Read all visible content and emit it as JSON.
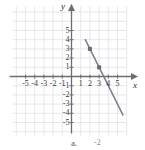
{
  "figure": {
    "width": 145,
    "height": 150,
    "background": "#ffffff",
    "axis_color": "#6d6d6d",
    "grid_color": "#e3e3ea",
    "line_color": "#7c7c86",
    "point_color": "#6a6a74",
    "label_color": "#3a3a3a"
  },
  "axes": {
    "x_name": "x",
    "y_name": "y",
    "x_ticks": [
      "-5",
      "-4",
      "-3",
      "-2",
      "-1",
      "1",
      "2",
      "3",
      "4",
      "5"
    ],
    "y_ticks": [
      "5",
      "4",
      "3",
      "2",
      "1",
      "-1",
      "-2",
      "-3",
      "-4",
      "-5"
    ],
    "x_tick_values": [
      -5,
      -4,
      -3,
      -2,
      -1,
      1,
      2,
      3,
      4,
      5
    ],
    "y_tick_values": [
      5,
      4,
      3,
      2,
      1,
      -1,
      -2,
      -3,
      -4,
      -5
    ]
  },
  "caption": {
    "letter": "a.",
    "value": "-2"
  },
  "chart_data": {
    "type": "line",
    "title": "",
    "xlabel": "x",
    "ylabel": "y",
    "xlim": [
      -6,
      6.2
    ],
    "ylim": [
      -6.2,
      7.2
    ],
    "grid": true,
    "legend": "none",
    "series": [
      {
        "name": "line",
        "slope": -2,
        "intercept": 7,
        "x": [
          1.5,
          5.6
        ],
        "y": [
          4.0,
          -4.2
        ]
      }
    ],
    "points": [
      {
        "x": 2,
        "y": 3,
        "marker": "square"
      },
      {
        "x": 3,
        "y": 1,
        "marker": "square"
      }
    ],
    "x_ticks": [
      -5,
      -4,
      -3,
      -2,
      -1,
      1,
      2,
      3,
      4,
      5
    ],
    "y_ticks": [
      5,
      4,
      3,
      2,
      1,
      -1,
      -2,
      -3,
      -4,
      -5
    ]
  }
}
